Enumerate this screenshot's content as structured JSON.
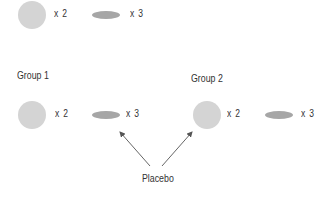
{
  "colors": {
    "circle": "#d4d4d4",
    "ellipse": "#a6a6a6",
    "arrow": "#555555",
    "text": "#333333"
  },
  "top_row": {
    "circle_count": "x 2",
    "ellipse_count": "x 3"
  },
  "groups": [
    {
      "label": "Group 1",
      "circle_count": "x 2",
      "ellipse_count": "x 3"
    },
    {
      "label": "Group 2",
      "circle_count": "x 2",
      "ellipse_count": "x 3"
    }
  ],
  "placebo": {
    "label": "Placebo"
  },
  "icons": {
    "circle": "round-pill-icon",
    "ellipse": "oval-pill-icon",
    "arrow": "arrow-icon"
  }
}
